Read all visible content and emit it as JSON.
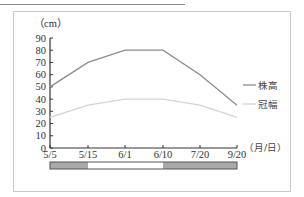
{
  "chart_data": {
    "type": "line",
    "title": "",
    "xlabel": "（月/日）",
    "ylabel": "（cm）",
    "categories": [
      "5/5",
      "5/15",
      "6/1",
      "6/10",
      "7/20",
      "9/20"
    ],
    "yticks": [
      0,
      10,
      20,
      30,
      40,
      50,
      60,
      70,
      80,
      90
    ],
    "ylim": [
      0,
      90
    ],
    "grid": false,
    "legend_position": "right",
    "series": [
      {
        "name": "株高",
        "values": [
          50,
          70,
          80,
          80,
          60,
          35
        ],
        "color": "#8c8c8c"
      },
      {
        "name": "冠幅",
        "values": [
          25,
          35,
          40,
          40,
          35,
          25
        ],
        "color": "#d4d4d4"
      }
    ],
    "period_bar": {
      "segments": [
        {
          "from": "5/5",
          "to": "5/15",
          "fill": "#a9a9a9"
        },
        {
          "from": "5/15",
          "to": "6/10",
          "fill": "#ffffff"
        },
        {
          "from": "6/10",
          "to": "9/20",
          "fill": "#a9a9a9"
        }
      ]
    }
  },
  "labels": {
    "y_unit": "（cm）",
    "x_unit": "（月/日）",
    "legend_height": "株高",
    "legend_width": "冠幅"
  }
}
